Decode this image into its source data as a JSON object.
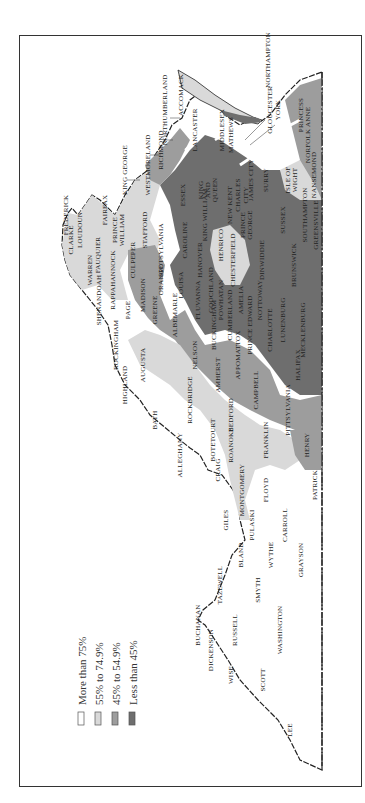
{
  "map": {
    "subject": "Virginia counties",
    "orientation": "rotated 90 degrees counter-clockwise",
    "colors": {
      "more_than_75": "#ffffff",
      "55_to_74_9": "#d9d9d9",
      "45_to_54_9": "#9d9d9d",
      "less_than_45": "#6e6e6e",
      "border": "#222222",
      "county_line": "#e8e8e8"
    }
  },
  "legend": {
    "items": [
      {
        "label": "More than 75%",
        "color": "#ffffff"
      },
      {
        "label": "55% to 74.9%",
        "color": "#d9d9d9"
      },
      {
        "label": "45% to 54.9%",
        "color": "#9d9d9d"
      },
      {
        "label": "Less than 45%",
        "color": "#6e6e6e"
      }
    ]
  },
  "counties": [
    {
      "name": "NORTHAMPTON",
      "x": 270,
      "y": 60,
      "cat": 3
    },
    {
      "name": "ACCOMACK",
      "x": 183,
      "y": 95,
      "cat": 1
    },
    {
      "name": "NORTHUMBERLAND",
      "x": 167,
      "y": 110,
      "cat": 2
    },
    {
      "name": "LANCASTER",
      "x": 197,
      "y": 130,
      "cat": 1
    },
    {
      "name": "RICHMOND",
      "x": 163,
      "y": 150,
      "cat": 3
    },
    {
      "name": "WESTMORELAND",
      "x": 150,
      "y": 165,
      "cat": 3
    },
    {
      "name": "MIDDLESEX",
      "x": 224,
      "y": 130,
      "cat": 1
    },
    {
      "name": "MATHEWS",
      "x": 233,
      "y": 135,
      "cat": 1
    },
    {
      "name": "GLOUCESTER",
      "x": 272,
      "y": 110,
      "cat": 3
    },
    {
      "name": "YORK",
      "x": 280,
      "y": 110,
      "cat": 3
    },
    {
      "name": "PRINCESS",
      "x": 303,
      "y": 115,
      "cat": 2
    },
    {
      "name": "NORFOLK ANNE",
      "x": 310,
      "y": 135,
      "cat": 2
    },
    {
      "name": "NANSEMOND",
      "x": 316,
      "y": 175,
      "cat": 2
    },
    {
      "name": "ISLE OF",
      "x": 290,
      "y": 180,
      "cat": 1
    },
    {
      "name": "WIGHT",
      "x": 297,
      "y": 180,
      "cat": 1
    },
    {
      "name": "SOUTHAMPTON",
      "x": 307,
      "y": 215,
      "cat": 3
    },
    {
      "name": "GREENSVILLE",
      "x": 318,
      "y": 225,
      "cat": 3
    },
    {
      "name": "SURRY",
      "x": 268,
      "y": 180,
      "cat": 3
    },
    {
      "name": "SUSSEX",
      "x": 285,
      "y": 220,
      "cat": 3
    },
    {
      "name": "KING GEORGE",
      "x": 127,
      "y": 170,
      "cat": 2
    },
    {
      "name": "ESSEX",
      "x": 185,
      "y": 195,
      "cat": 3
    },
    {
      "name": "KING",
      "x": 203,
      "y": 190,
      "cat": 3
    },
    {
      "name": "AND",
      "x": 210,
      "y": 190,
      "cat": 3
    },
    {
      "name": "QUEEN",
      "x": 217,
      "y": 190,
      "cat": 3
    },
    {
      "name": "KING WILLIAM",
      "x": 207,
      "y": 215,
      "cat": 3
    },
    {
      "name": "NEW KENT",
      "x": 232,
      "y": 205,
      "cat": 3
    },
    {
      "name": "CHARLES",
      "x": 240,
      "y": 195,
      "cat": 3
    },
    {
      "name": "CITY",
      "x": 248,
      "y": 195,
      "cat": 3
    },
    {
      "name": "JAMES CITY",
      "x": 253,
      "y": 180,
      "cat": 3
    },
    {
      "name": "PRINCE",
      "x": 245,
      "y": 225,
      "cat": 3
    },
    {
      "name": "GEORGE",
      "x": 252,
      "y": 225,
      "cat": 3
    },
    {
      "name": "FAIRFAX",
      "x": 107,
      "y": 210,
      "cat": 1
    },
    {
      "name": "PRINCE",
      "x": 117,
      "y": 230,
      "cat": 1
    },
    {
      "name": "WILLIAM",
      "x": 124,
      "y": 230,
      "cat": 1
    },
    {
      "name": "STAFFORD",
      "x": 147,
      "y": 230,
      "cat": 0
    },
    {
      "name": "CAROLINE",
      "x": 187,
      "y": 240,
      "cat": 3
    },
    {
      "name": "HANOVER",
      "x": 202,
      "y": 260,
      "cat": 2
    },
    {
      "name": "HENRICO",
      "x": 223,
      "y": 245,
      "cat": 1
    },
    {
      "name": "CHESTERFIELD",
      "x": 235,
      "y": 260,
      "cat": 1
    },
    {
      "name": "DINWIDDIE",
      "x": 264,
      "y": 260,
      "cat": 3
    },
    {
      "name": "BRUNSWICK",
      "x": 296,
      "y": 265,
      "cat": 3
    },
    {
      "name": "LOUDOUN",
      "x": 82,
      "y": 230,
      "cat": 1
    },
    {
      "name": "CLARKE",
      "x": 73,
      "y": 240,
      "cat": 1
    },
    {
      "name": "FREDERICK",
      "x": 68,
      "y": 215,
      "cat": 0
    },
    {
      "name": "FAUQUIER",
      "x": 100,
      "y": 255,
      "cat": 1
    },
    {
      "name": "WARREN",
      "x": 92,
      "y": 270,
      "cat": 1
    },
    {
      "name": "RAPPAHANNOCK",
      "x": 115,
      "y": 280,
      "cat": 1
    },
    {
      "name": "CULPEPER",
      "x": 135,
      "y": 260,
      "cat": 2
    },
    {
      "name": "SPOTSYLVANIA",
      "x": 163,
      "y": 250,
      "cat": 1
    },
    {
      "name": "ORANGE",
      "x": 163,
      "y": 280,
      "cat": 2
    },
    {
      "name": "LOUISA",
      "x": 183,
      "y": 285,
      "cat": 3
    },
    {
      "name": "GOOCHLAND",
      "x": 213,
      "y": 290,
      "cat": 3
    },
    {
      "name": "POWHATAN",
      "x": 223,
      "y": 300,
      "cat": 3
    },
    {
      "name": "AMELIA",
      "x": 243,
      "y": 300,
      "cat": 3
    },
    {
      "name": "NOTTOWAY",
      "x": 262,
      "y": 300,
      "cat": 3
    },
    {
      "name": "LUNENBURG",
      "x": 285,
      "y": 320,
      "cat": 3
    },
    {
      "name": "MECKLENBURG",
      "x": 305,
      "y": 330,
      "cat": 3
    },
    {
      "name": "SHENANDOAH",
      "x": 101,
      "y": 300,
      "cat": 0
    },
    {
      "name": "PAGE",
      "x": 130,
      "y": 310,
      "cat": 0
    },
    {
      "name": "MADISON",
      "x": 145,
      "y": 295,
      "cat": 2
    },
    {
      "name": "GREENE",
      "x": 157,
      "y": 310,
      "cat": 1
    },
    {
      "name": "ALBEMARLE",
      "x": 177,
      "y": 315,
      "cat": 2
    },
    {
      "name": "FLUVANNA",
      "x": 200,
      "y": 300,
      "cat": 2
    },
    {
      "name": "CUMBERLAND",
      "x": 232,
      "y": 315,
      "cat": 3
    },
    {
      "name": "BUCKINGHAM",
      "x": 216,
      "y": 325,
      "cat": 3
    },
    {
      "name": "PRINCE EDWARD",
      "x": 252,
      "y": 325,
      "cat": 3
    },
    {
      "name": "CHARLOTTE",
      "x": 272,
      "y": 330,
      "cat": 3
    },
    {
      "name": "HALIFAX",
      "x": 300,
      "y": 365,
      "cat": 3
    },
    {
      "name": "ROCKINGHAM",
      "x": 118,
      "y": 345,
      "cat": 0
    },
    {
      "name": "AUGUSTA",
      "x": 145,
      "y": 365,
      "cat": 1
    },
    {
      "name": "NELSON",
      "x": 197,
      "y": 355,
      "cat": 2
    },
    {
      "name": "APPOMATTOX",
      "x": 240,
      "y": 355,
      "cat": 2
    },
    {
      "name": "AMHERST",
      "x": 220,
      "y": 375,
      "cat": 2
    },
    {
      "name": "CAMPBELL",
      "x": 258,
      "y": 390,
      "cat": 2
    },
    {
      "name": "PITTSYLVANIA",
      "x": 290,
      "y": 410,
      "cat": 2
    },
    {
      "name": "HIGHLAND",
      "x": 127,
      "y": 385,
      "cat": 0
    },
    {
      "name": "ROCKBRIDGE",
      "x": 192,
      "y": 400,
      "cat": 1
    },
    {
      "name": "BATH",
      "x": 157,
      "y": 420,
      "cat": 0
    },
    {
      "name": "BEDFORD",
      "x": 233,
      "y": 415,
      "cat": 1
    },
    {
      "name": "BOTETOURT",
      "x": 215,
      "y": 440,
      "cat": 0
    },
    {
      "name": "ALLEGHANY",
      "x": 182,
      "y": 455,
      "cat": 0
    },
    {
      "name": "ROANOKE",
      "x": 233,
      "y": 445,
      "cat": 1
    },
    {
      "name": "FRANKLIN",
      "x": 268,
      "y": 440,
      "cat": 1
    },
    {
      "name": "HENRY",
      "x": 309,
      "y": 445,
      "cat": 2
    },
    {
      "name": "CRAIG",
      "x": 220,
      "y": 470,
      "cat": 0
    },
    {
      "name": "MONTGOMERY",
      "x": 244,
      "y": 490,
      "cat": 1
    },
    {
      "name": "FLOYD",
      "x": 268,
      "y": 490,
      "cat": 0
    },
    {
      "name": "PATRICK",
      "x": 317,
      "y": 485,
      "cat": 0
    },
    {
      "name": "GILES",
      "x": 228,
      "y": 520,
      "cat": 0
    },
    {
      "name": "PULASKI",
      "x": 254,
      "y": 525,
      "cat": 0
    },
    {
      "name": "CARROLL",
      "x": 287,
      "y": 525,
      "cat": 0
    },
    {
      "name": "BLAND",
      "x": 243,
      "y": 555,
      "cat": 0
    },
    {
      "name": "WYTHE",
      "x": 273,
      "y": 555,
      "cat": 0
    },
    {
      "name": "GRAYSON",
      "x": 303,
      "y": 560,
      "cat": 0
    },
    {
      "name": "TAZEWELL",
      "x": 222,
      "y": 585,
      "cat": 0
    },
    {
      "name": "SMYTH",
      "x": 260,
      "y": 590,
      "cat": 0
    },
    {
      "name": "BUCHANAN",
      "x": 200,
      "y": 625,
      "cat": 0
    },
    {
      "name": "RUSSELL",
      "x": 237,
      "y": 630,
      "cat": 0
    },
    {
      "name": "WASHINGTON",
      "x": 282,
      "y": 630,
      "cat": 0
    },
    {
      "name": "DICKENSON",
      "x": 213,
      "y": 650,
      "cat": 0
    },
    {
      "name": "WISE",
      "x": 233,
      "y": 675,
      "cat": 0
    },
    {
      "name": "SCOTT",
      "x": 265,
      "y": 680,
      "cat": 0
    },
    {
      "name": "LEE",
      "x": 292,
      "y": 730,
      "cat": 0
    }
  ]
}
